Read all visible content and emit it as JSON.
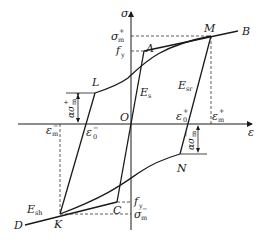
{
  "diagram": {
    "axes": {
      "y_label": "σ",
      "x_label": "ε",
      "origin_label": "O"
    },
    "points": {
      "A": "A",
      "B": "B",
      "C": "C",
      "D": "D",
      "K": "K",
      "L": "L",
      "M": "M",
      "N": "N"
    },
    "labels": {
      "sigma_m_plus": {
        "base": "σ",
        "sub": "m",
        "sup": "+"
      },
      "fy_top": {
        "base": "f",
        "sub": "y"
      },
      "fy_bottom": {
        "base": "f",
        "sub": "y"
      },
      "sigma_m_minus": {
        "base": "σ",
        "sub": "m",
        "sup": "−"
      },
      "epsilon_m_plus": {
        "base": "ε",
        "sub": "m",
        "sup": "+"
      },
      "epsilon_m_minus": {
        "base": "ε",
        "sub": "m",
        "sup": "−"
      },
      "epsilon_0_plus": {
        "base": "ε",
        "sub": "0",
        "sup": "+"
      },
      "epsilon_0_minus": {
        "base": "ε",
        "sub": "0",
        "sup": "−"
      },
      "E_s": {
        "base": "E",
        "sub": "s"
      },
      "E_sr": {
        "base": "E",
        "sub": "sr"
      },
      "E_sh": {
        "base": "E",
        "sub": "sh"
      },
      "alpha_sigma_m_plus": {
        "base": "ασ",
        "sub": "m",
        "sup": "+"
      },
      "alpha_sigma_m_minus": {
        "base": "ασ",
        "sub": "m",
        "sup": "−"
      }
    },
    "colors": {
      "line": "#1a1a1a",
      "background": "#ffffff"
    }
  }
}
